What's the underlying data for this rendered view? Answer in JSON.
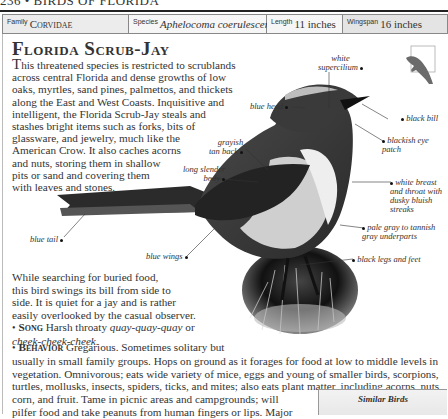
{
  "page_header": "236 • BIRDS OF FLORIDA",
  "info_bar": {
    "family": {
      "label": "Family",
      "value": "Corvidae"
    },
    "species": {
      "label": "Species",
      "value": "Aphelocoma coerulescens"
    },
    "length": {
      "label": "Length",
      "value": "11 inches"
    },
    "wingspan": {
      "label": "Wingspan",
      "value": "16 inches"
    }
  },
  "title": "Florida Scrub-Jay",
  "intro": {
    "drop": "T",
    "lines": [
      "his threatened species is restricted to scrublands",
      "across central Florida and dense growths of low",
      "oaks, myrtles, sand pines, palmettos, and thickets",
      "along the East and West Coasts. Inquisitive and",
      "intelligent, the Florida Scrub-Jay steals and",
      "stashes bright items such as forks, bits of",
      "glassware, and jewelry, much like the",
      "American Crow. It also caches acorns",
      "and nuts, storing them in shallow",
      "pits or sand and covering them",
      "with leaves and stones."
    ]
  },
  "callouts": {
    "white_supercilium": [
      "white",
      "supercilium"
    ],
    "blue_head": "blue head",
    "black_bill": "black bill",
    "blackish_eye_patch": [
      "blackish eye",
      "patch"
    ],
    "grayish_tan_back": [
      "grayish",
      "tan back"
    ],
    "long_slender_body": [
      "long slender",
      "body"
    ],
    "white_breast": [
      "white breast",
      "and throat with",
      "dusky bluish",
      "streaks"
    ],
    "pale_gray_underparts": [
      "pale gray to tannish",
      "gray underparts"
    ],
    "black_legs": "black legs and feet",
    "blue_tail": "blue tail",
    "blue_wings": "blue wings"
  },
  "lower": {
    "lines": [
      "While searching for buried food,",
      "this bird swings its bill from side to",
      "side. It is quiet for a jay and is rather",
      "easily overlooked by the casual observer."
    ],
    "song": {
      "heading": "Song",
      "text": "Harsh throaty ",
      "call1": "quay-quay-quay",
      "or": " or",
      "call2": "cheek-cheek-cheek",
      "end": "."
    }
  },
  "behavior": {
    "heading": "Behavior",
    "lines": [
      "Gregarious. Sometimes solitary but",
      "usually in small family groups. Hops on ground as it forages for food at low to middle levels in",
      "vegetation. Omnivorous; eats wide variety of mice, eggs and young of smaller birds, scorpions,",
      "turtles, mollusks, insects, spiders, ticks, and mites; also eats plant matter, including acorns, nuts,",
      "corn, and fruit. Tame in picnic areas and campgrounds; will",
      "pilfer food and take peanuts from human fingers or lips. Major"
    ]
  },
  "similar_birds": {
    "title": "Similar Birds"
  },
  "colors": {
    "rule": "#222222",
    "info_bar": "#ececec",
    "text": "#333333",
    "silhouette": "#6b6b6b"
  }
}
